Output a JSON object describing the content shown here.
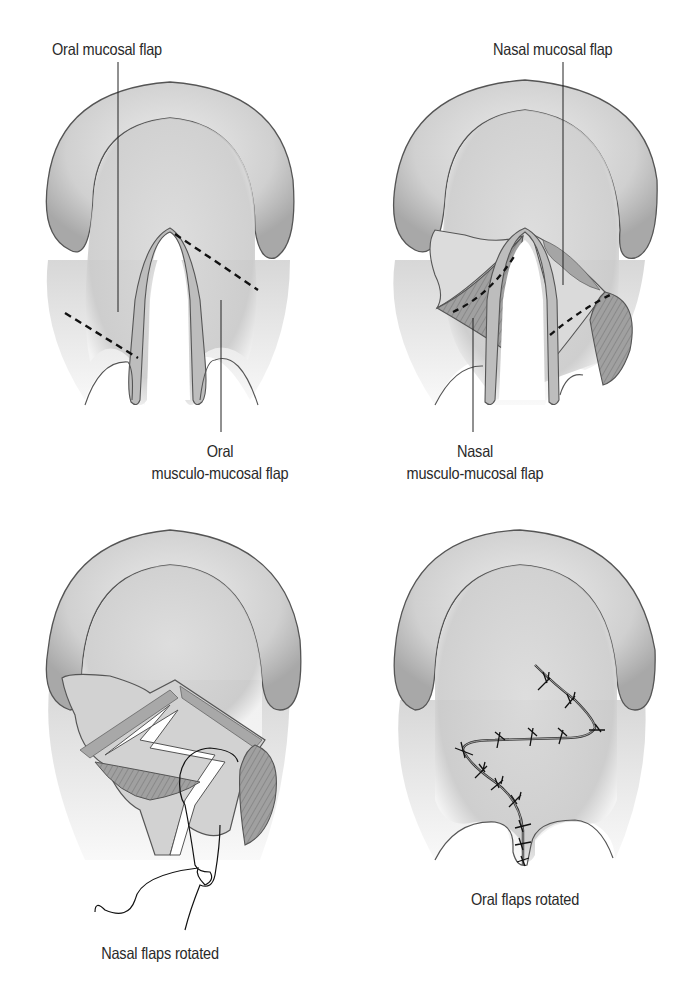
{
  "figure": {
    "panels": [
      {
        "id": "a",
        "labels": {
          "top": "Oral mucosal flap",
          "bottom_line1": "Oral",
          "bottom_line2": "musculo-mucosal flap"
        }
      },
      {
        "id": "b",
        "labels": {
          "top": "Nasal mucosal flap",
          "bottom_line1": "Nasal",
          "bottom_line2": "musculo-mucosal flap"
        }
      },
      {
        "id": "c",
        "labels": {
          "caption": "Nasal flaps rotated"
        }
      },
      {
        "id": "d",
        "labels": {
          "caption": "Oral flaps rotated"
        }
      }
    ],
    "colors": {
      "background": "#ffffff",
      "tissue_fill": "#d6d6d6",
      "ridge_fill": "#cfcfcf",
      "outline": "#555555",
      "muscle_fill": "#9a9a9a",
      "text": "#2a2a2a"
    }
  }
}
